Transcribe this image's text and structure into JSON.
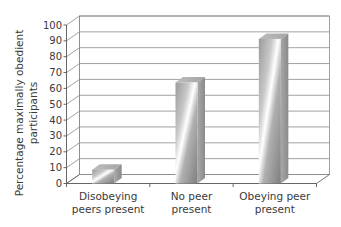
{
  "chart_data": {
    "type": "bar",
    "style": "3d-column",
    "title": "",
    "xlabel": "",
    "ylabel": "Percentage maximally obedient participants",
    "ylabel_lines": [
      "Percentage maximally obedient",
      "participants"
    ],
    "categories": [
      "Disobeying peers present",
      "No peer present",
      "Obeying peer present"
    ],
    "category_lines": [
      [
        "Disobeying",
        "peers present"
      ],
      [
        "No peer",
        "present"
      ],
      [
        "Obeying peer",
        "present"
      ]
    ],
    "values": [
      10,
      65,
      92.5
    ],
    "ylim": [
      0,
      100
    ],
    "yticks": [
      0,
      10,
      20,
      30,
      40,
      50,
      60,
      70,
      80,
      90,
      100
    ],
    "grid": true,
    "legend": null,
    "colors": {
      "bar_dark": "#8c8c8c",
      "bar_light": "#ffffff",
      "bar_side": "#9a9a9a",
      "bar_top": "#b8b8b8",
      "grid": "#8a8a8a",
      "axis": "#555555"
    }
  }
}
